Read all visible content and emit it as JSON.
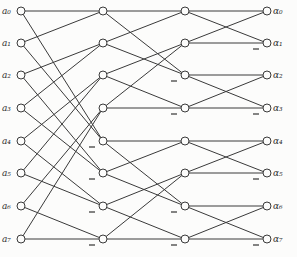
{
  "diagram": {
    "type": "fft-signal-flow-graph",
    "columns": 4,
    "rows": 8,
    "input_labels": [
      "a0",
      "a1",
      "a2",
      "a3",
      "a4",
      "a5",
      "a6",
      "a7"
    ],
    "input_label_display": [
      "a₀",
      "a₁",
      "a₂",
      "a₃",
      "a₄",
      "a₅",
      "a₆",
      "a₇"
    ],
    "output_labels": [
      "α0",
      "α1",
      "α2",
      "α3",
      "α4",
      "α5",
      "α6",
      "α7"
    ],
    "output_label_display": [
      "α₀",
      "α₁",
      "α₂",
      "α₃",
      "α₄",
      "α₅",
      "α₆",
      "α₇"
    ],
    "stages": [
      {
        "from_col": 0,
        "to_col": 1,
        "edges": [
          [
            0,
            0
          ],
          [
            0,
            4
          ],
          [
            1,
            0
          ],
          [
            1,
            4
          ],
          [
            2,
            1
          ],
          [
            2,
            5
          ],
          [
            3,
            1
          ],
          [
            3,
            5
          ],
          [
            4,
            2
          ],
          [
            4,
            6
          ],
          [
            5,
            2
          ],
          [
            5,
            6
          ],
          [
            6,
            3
          ],
          [
            6,
            7
          ],
          [
            7,
            3
          ],
          [
            7,
            7
          ]
        ],
        "negated_targets": [
          4,
          5,
          6,
          7
        ]
      },
      {
        "from_col": 1,
        "to_col": 2,
        "edges": [
          [
            0,
            0
          ],
          [
            0,
            2
          ],
          [
            1,
            0
          ],
          [
            1,
            2
          ],
          [
            2,
            1
          ],
          [
            2,
            3
          ],
          [
            3,
            1
          ],
          [
            3,
            3
          ],
          [
            4,
            4
          ],
          [
            4,
            6
          ],
          [
            5,
            4
          ],
          [
            5,
            6
          ],
          [
            6,
            5
          ],
          [
            6,
            7
          ],
          [
            7,
            5
          ],
          [
            7,
            7
          ]
        ],
        "negated_targets": [
          2,
          3,
          6,
          7
        ]
      },
      {
        "from_col": 2,
        "to_col": 3,
        "edges": [
          [
            0,
            0
          ],
          [
            0,
            1
          ],
          [
            1,
            0
          ],
          [
            1,
            1
          ],
          [
            2,
            2
          ],
          [
            2,
            3
          ],
          [
            3,
            2
          ],
          [
            3,
            3
          ],
          [
            4,
            4
          ],
          [
            4,
            5
          ],
          [
            5,
            4
          ],
          [
            5,
            5
          ],
          [
            6,
            6
          ],
          [
            6,
            7
          ],
          [
            7,
            6
          ],
          [
            7,
            7
          ]
        ],
        "negated_targets": [
          1,
          3,
          5,
          7
        ]
      }
    ],
    "minus_sign": "−"
  }
}
